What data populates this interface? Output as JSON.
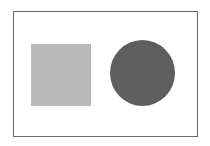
{
  "diagram": {
    "frame": {
      "border_color": "#6a6a6a"
    },
    "shapes": [
      {
        "type": "square",
        "color": "#b9b9b9"
      },
      {
        "type": "circle",
        "color": "#5e5e5e"
      }
    ]
  }
}
